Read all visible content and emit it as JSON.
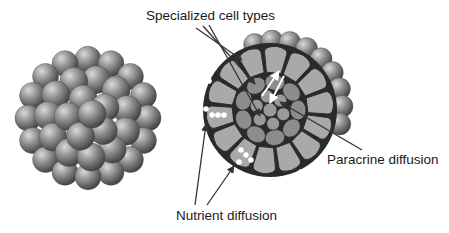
{
  "figure": {
    "panels": [
      {
        "name": "spheroid-exterior",
        "description": "Aggregated spherical cells forming a 3D spheroid"
      },
      {
        "name": "spheroid-cross-section",
        "description": "Cross-section showing outer ring of cells and inner core of specialized cells"
      }
    ],
    "labels": {
      "specialized": "Specialized cell types",
      "paracrine": "Paracrine diffusion",
      "nutrient": "Nutrient diffusion"
    },
    "colors": {
      "sphere_light": "#c8c8c8",
      "sphere_mid": "#8a8a8a",
      "sphere_dark": "#3a3a3a",
      "outer_cell": "#a9a9a9",
      "inner_cell": "#8c8c8c",
      "core_cell": "#9a9a9a",
      "outline": "#2a2a2a",
      "arrow": "#333333",
      "nutrient_dot": "#ffffff"
    }
  }
}
